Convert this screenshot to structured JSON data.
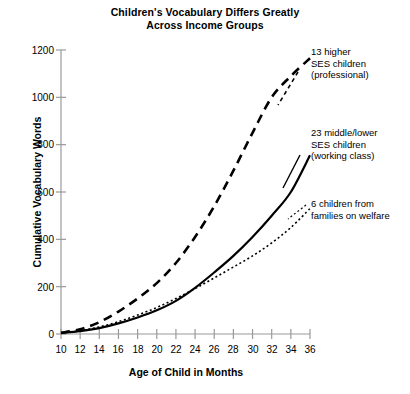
{
  "chart_data": {
    "type": "line",
    "title": "Children's Vocabulary Differs Greatly Across Income Groups",
    "title_line1": "Children's Vocabulary Differs Greatly",
    "title_line2": "Across Income Groups",
    "xlabel": "Age of Child in Months",
    "ylabel": "Cumulative Vocabulary Words",
    "xlim": [
      10,
      36
    ],
    "ylim": [
      0,
      1200
    ],
    "xticks": [
      10,
      12,
      14,
      16,
      18,
      20,
      22,
      24,
      26,
      28,
      30,
      32,
      34,
      36
    ],
    "yticks": [
      0,
      200,
      400,
      600,
      800,
      1000,
      1200
    ],
    "grid": false,
    "legend_position": "inline-annotations-right",
    "x": [
      10,
      12,
      14,
      16,
      18,
      20,
      22,
      24,
      26,
      28,
      30,
      32,
      34,
      36
    ],
    "series": [
      {
        "name": "13 higher SES children (professional)",
        "style": "dashed",
        "color": "#000000",
        "values": [
          5,
          20,
          50,
          95,
          150,
          215,
          300,
          410,
          540,
          690,
          850,
          1000,
          1090,
          1165
        ],
        "annotation": {
          "line1": "13 higher",
          "line2": "SES children",
          "line3": "(professional)"
        }
      },
      {
        "name": "23 middle/lower SES children (working class)",
        "style": "solid",
        "color": "#000000",
        "values": [
          4,
          12,
          25,
          45,
          70,
          100,
          140,
          195,
          260,
          330,
          410,
          500,
          600,
          755
        ],
        "annotation": {
          "line1": "23 middle/lower",
          "line2": "SES children",
          "line3": "(working class)"
        }
      },
      {
        "name": "6 children from families on welfare",
        "style": "dotted",
        "color": "#000000",
        "values": [
          4,
          14,
          30,
          52,
          80,
          112,
          150,
          192,
          237,
          283,
          330,
          385,
          450,
          530
        ],
        "annotation": {
          "line1": "6 children from",
          "line2": "families on welfare"
        }
      }
    ]
  }
}
